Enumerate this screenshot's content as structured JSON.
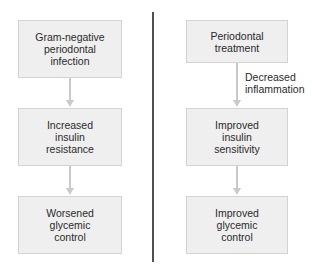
{
  "diagram": {
    "type": "flowchart",
    "left_column": {
      "nodes": [
        {
          "label": "Gram-negative\nperiodontal\ninfection"
        },
        {
          "label": "Increased\ninsulin\nresistance"
        },
        {
          "label": "Worsened\nglycemic\ncontrol"
        }
      ],
      "edges": [
        {
          "from": 0,
          "to": 1,
          "label": ""
        },
        {
          "from": 1,
          "to": 2,
          "label": ""
        }
      ]
    },
    "right_column": {
      "nodes": [
        {
          "label": "Periodontal\ntreatment"
        },
        {
          "label": "Improved\ninsulin\nsensitivity"
        },
        {
          "label": "Improved\nglycemic\ncontrol"
        }
      ],
      "edges": [
        {
          "from": 0,
          "to": 1,
          "label": "Decreased\ninflammation"
        },
        {
          "from": 1,
          "to": 2,
          "label": ""
        }
      ]
    },
    "colors": {
      "box_fill": "#efefef",
      "box_border": "#d3d3d3",
      "arrow": "#c9c9c9",
      "divider": "#505050",
      "text": "#2a2a2a"
    }
  }
}
